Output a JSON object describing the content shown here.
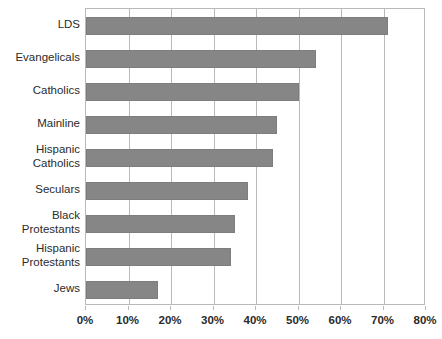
{
  "chart_data": {
    "type": "bar",
    "orientation": "horizontal",
    "title": "",
    "subtitle": "",
    "xlabel": "",
    "ylabel": "",
    "categories": [
      "LDS",
      "Evangelicals",
      "Catholics",
      "Mainline",
      "Hispanic\nCatholics",
      "Seculars",
      "Black\nProtestants",
      "Hispanic\nProtestants",
      "Jews"
    ],
    "values": [
      71,
      54,
      50,
      45,
      44,
      38,
      35,
      34,
      17
    ],
    "value_unit": "%",
    "xlim": [
      0,
      80
    ],
    "xticks": [
      0,
      10,
      20,
      30,
      40,
      50,
      60,
      70,
      80
    ],
    "xtick_labels": [
      "0%",
      "10%",
      "20%",
      "30%",
      "40%",
      "50%",
      "60%",
      "70%",
      "80%"
    ],
    "grid": true,
    "grid_axis": "x",
    "legend": false,
    "legend_position": "none",
    "bar_color": "#868686",
    "bar_border_color": "#7d7d7d",
    "plot_border_color": "#b9b9b9",
    "background_color": "#ffffff",
    "text_color": "#2b2b2b",
    "series": [
      {
        "name": "",
        "values": [
          71,
          54,
          50,
          45,
          44,
          38,
          35,
          34,
          17
        ]
      }
    ]
  }
}
